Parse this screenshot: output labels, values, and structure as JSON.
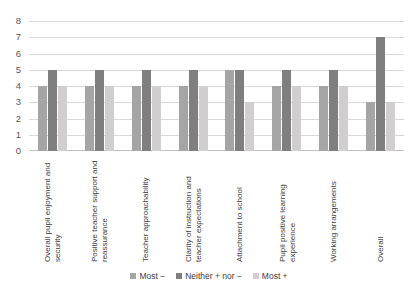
{
  "chart_data": {
    "type": "bar",
    "title": "",
    "xlabel": "",
    "ylabel": "",
    "ylim": [
      0,
      8
    ],
    "ytick_step": 1,
    "yticks": [
      8,
      7,
      6,
      5,
      4,
      3,
      2,
      1,
      0
    ],
    "grid": true,
    "legend_position": "bottom",
    "categories": [
      "Overall pupil enjoyment and security",
      "Positive teacher support and reassurance",
      "Teacher approachability",
      "Clarity of instruction and teacher expectations",
      "Attachment to school",
      "Pupil positive learning experience",
      "Working arrangements",
      "Overall"
    ],
    "series": [
      {
        "name": "Most −",
        "color": "#a5a5a5",
        "values": [
          4,
          4,
          4,
          4,
          5,
          4,
          4,
          3
        ]
      },
      {
        "name": "Neither + nor −",
        "color": "#7f7f7f",
        "values": [
          5,
          5,
          5,
          5,
          5,
          5,
          5,
          7
        ]
      },
      {
        "name": "Most +",
        "color": "#d0cece",
        "values": [
          4,
          4,
          4,
          4,
          3,
          4,
          4,
          3
        ]
      }
    ]
  }
}
